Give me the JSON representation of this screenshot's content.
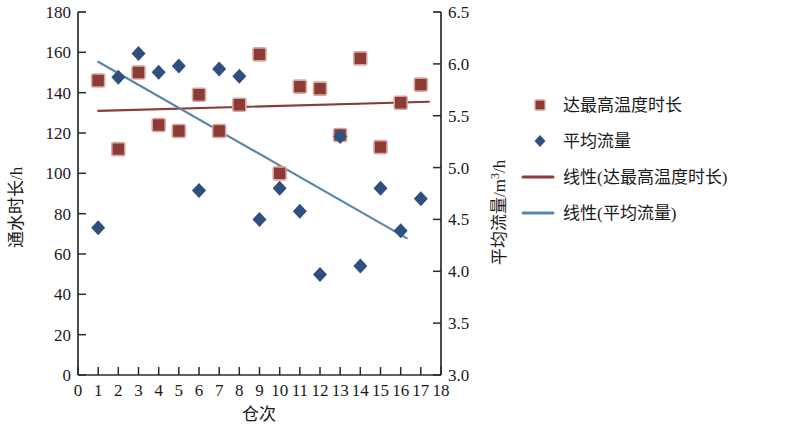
{
  "chart_data": {
    "type": "scatter",
    "title": "",
    "xlabel": "仓次",
    "ylabel": "通水时长/h",
    "y2label": "平均流量/m³/h",
    "xlim": [
      0,
      18
    ],
    "ylim": [
      0,
      180
    ],
    "y2lim": [
      3.0,
      6.5
    ],
    "grid": false,
    "legend_position": "right",
    "x_ticks": [
      "0",
      "1",
      "2",
      "3",
      "4",
      "5",
      "6",
      "7",
      "8",
      "9",
      "10",
      "11",
      "12",
      "13",
      "14",
      "15",
      "16",
      "17",
      "18"
    ],
    "y_ticks": [
      "0",
      "20",
      "40",
      "60",
      "80",
      "100",
      "120",
      "140",
      "160",
      "180"
    ],
    "y2_ticks": [
      "3.0",
      "3.5",
      "4.0",
      "4.5",
      "5.0",
      "5.5",
      "6.0",
      "6.5"
    ],
    "x": [
      1,
      2,
      3,
      4,
      5,
      6,
      7,
      8,
      9,
      10,
      11,
      12,
      13,
      14,
      15,
      16,
      17
    ],
    "series": [
      {
        "name": "达最高温度时长",
        "axis": "left",
        "marker": "square",
        "color": "#8c3b36",
        "values": [
          146,
          112,
          150,
          124,
          121,
          139,
          121,
          134,
          159,
          100,
          143,
          142,
          119,
          157,
          113,
          135,
          144
        ]
      },
      {
        "name": "平均流量",
        "axis": "right",
        "marker": "diamond",
        "color": "#2f4f7f",
        "values": [
          4.42,
          5.87,
          6.1,
          5.92,
          5.98,
          4.78,
          5.95,
          5.88,
          4.5,
          4.8,
          4.58,
          3.97,
          5.3,
          4.05,
          4.8,
          4.39,
          4.7
        ]
      }
    ],
    "trendlines": [
      {
        "name": "线性(达最高温度时长)",
        "axis": "left",
        "color": "#8c3b36",
        "x_start": 1,
        "x_end": 17.4,
        "y_start": 131,
        "y_end": 135.5
      },
      {
        "name": "线性(平均流量)",
        "axis": "right",
        "color": "#5b86ab",
        "x_start": 1,
        "x_end": 16.3,
        "y_start": 6.02,
        "y_end": 4.32
      }
    ],
    "legend": [
      {
        "label": "达最高温度时长",
        "type": "square",
        "color": "#8c3b36"
      },
      {
        "label": "平均流量",
        "type": "diamond",
        "color": "#2f4f7f"
      },
      {
        "label": "线性(达最高温度时长)",
        "type": "line",
        "color": "#8c3b36"
      },
      {
        "label": "线性(平均流量)",
        "type": "line",
        "color": "#5b86ab"
      }
    ]
  },
  "axes": {
    "y_label_main": "通水时长/h",
    "y2_label_prefix": "平均流量/m",
    "y2_label_sup": "3",
    "y2_label_suffix": "/h",
    "x_label": "仓次"
  }
}
